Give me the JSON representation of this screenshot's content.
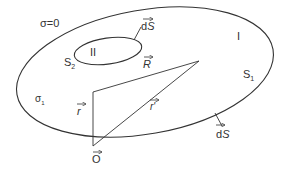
{
  "diagram": {
    "regions": {
      "outside": "σ=0",
      "region_I": "I",
      "region_II": "II"
    },
    "surfaces": {
      "outer": {
        "name": "S",
        "sub": "1"
      },
      "inner": {
        "name": "S",
        "sub": "2"
      }
    },
    "conductivity": {
      "name": "σ",
      "sub": "1"
    },
    "vectors": {
      "dS_inner": "dS",
      "dS_outer": "dS",
      "R": "R",
      "r": "r",
      "r_prime": "r'",
      "origin": "O"
    },
    "colors": {
      "stroke": "#333333",
      "background": "#ffffff"
    }
  }
}
